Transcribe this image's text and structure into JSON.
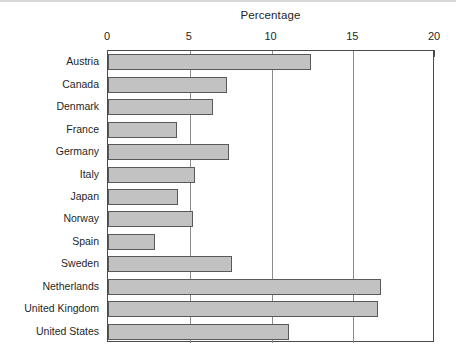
{
  "chart_data": {
    "type": "bar",
    "orientation": "horizontal",
    "title": "Percentage",
    "xlabel": "",
    "ylabel": "",
    "xlim": [
      0,
      20
    ],
    "xticks": [
      0,
      5,
      10,
      15,
      20
    ],
    "xtick_labels": [
      "0",
      "5",
      "10",
      "15",
      "20"
    ],
    "grid": true,
    "grid_axis": "x",
    "axis_position": "top",
    "legend": null,
    "categories": [
      "Austria",
      "Canada",
      "Denmark",
      "France",
      "Germany",
      "Italy",
      "Japan",
      "Norway",
      "Spain",
      "Sweden",
      "Netherlands",
      "United Kingdom",
      "United States"
    ],
    "values": [
      12.4,
      7.3,
      6.4,
      4.2,
      7.4,
      5.3,
      4.3,
      5.2,
      2.9,
      7.6,
      16.7,
      16.5,
      11.1
    ],
    "bar_fill": "#c2c2c2",
    "bar_border": "#595959",
    "axis_color": "#4a4a4a",
    "grid_color": "#8c8c8c",
    "background": "#ffffff"
  }
}
